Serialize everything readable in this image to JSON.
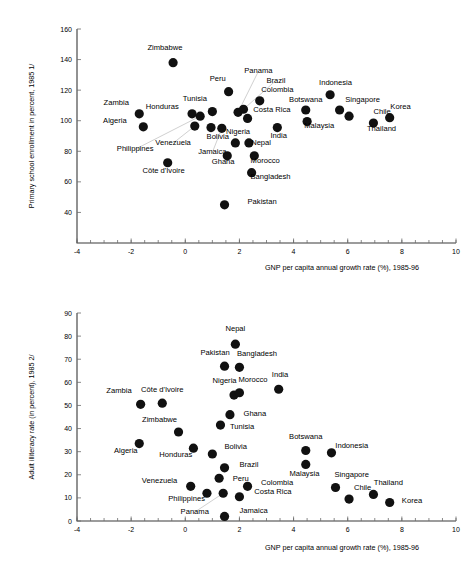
{
  "document": {
    "title": "Primary school enrollment and adult illiteracy vs GNP per capita growth"
  },
  "chart_data": [
    {
      "type": "scatter",
      "id": "chart-primary-enrollment",
      "title": "",
      "xlabel": "GNP per capita annual growth rate (%), 1985-96",
      "ylabel": "Primary school enrollment in percent, 1985 1/",
      "xlim": [
        -4,
        10
      ],
      "ylim": [
        20,
        160
      ],
      "xticks": [
        -4,
        -2,
        0,
        2,
        4,
        6,
        8,
        10
      ],
      "yticks": [
        40,
        60,
        80,
        100,
        120,
        140,
        160
      ],
      "xtick_labels": [
        "-4",
        "-2",
        "0",
        "2",
        "4",
        "6",
        "8",
        "10"
      ],
      "ytick_labels": [
        "40",
        "60",
        "80",
        "100",
        "120",
        "140",
        "160"
      ],
      "grid": false,
      "legend": "none",
      "points": [
        {
          "label": "Zimbabwe",
          "x": -0.45,
          "y": 138.0,
          "lx": -0.75,
          "ly": 146.5,
          "anchor": "middle",
          "leader": false
        },
        {
          "label": "Zambia",
          "x": -1.7,
          "y": 104.5,
          "lx": -2.55,
          "ly": 110.5,
          "anchor": "middle",
          "leader": false
        },
        {
          "label": "Algeria",
          "x": -1.55,
          "y": 96.0,
          "lx": -2.6,
          "ly": 98.5,
          "anchor": "middle",
          "leader": false
        },
        {
          "label": "Honduras",
          "x": 0.25,
          "y": 104.5,
          "lx": -0.85,
          "ly": 107.5,
          "anchor": "middle",
          "leader": false
        },
        {
          "label": "Tunisia",
          "x": 1.0,
          "y": 106.0,
          "lx": 0.35,
          "ly": 113.0,
          "anchor": "middle",
          "leader": false
        },
        {
          "label": "Peru",
          "x": 1.6,
          "y": 119.0,
          "lx": 1.2,
          "ly": 126.0,
          "anchor": "middle",
          "leader": false
        },
        {
          "label": "Panama",
          "x": 1.95,
          "y": 105.5,
          "lx": 2.7,
          "ly": 131.0,
          "anchor": "middle",
          "leader": true
        },
        {
          "label": "Brazil",
          "x": 2.15,
          "y": 107.5,
          "lx": 3.35,
          "ly": 125.0,
          "anchor": "middle",
          "leader": true
        },
        {
          "label": "Colombia",
          "x": 2.75,
          "y": 113.0,
          "lx": 3.4,
          "ly": 119.0,
          "anchor": "middle",
          "leader": false
        },
        {
          "label": "Costa Rica",
          "x": 2.3,
          "y": 101.5,
          "lx": 3.2,
          "ly": 106.0,
          "anchor": "middle",
          "leader": false
        },
        {
          "label": "Bolivia",
          "x": 0.95,
          "y": 95.5,
          "lx": 1.2,
          "ly": 88.0,
          "anchor": "middle",
          "leader": false
        },
        {
          "label": "Venezuela",
          "x": 0.35,
          "y": 96.5,
          "lx": -0.45,
          "ly": 84.0,
          "anchor": "middle",
          "leader": true
        },
        {
          "label": "Philippines",
          "x": 0.55,
          "y": 103.0,
          "lx": -1.85,
          "ly": 80.0,
          "anchor": "middle",
          "leader": true
        },
        {
          "label": "Jamaica",
          "x": 1.35,
          "y": 95.0,
          "lx": 1.0,
          "ly": 78.0,
          "anchor": "middle",
          "leader": true
        },
        {
          "label": "Nigeria",
          "x": 1.85,
          "y": 85.5,
          "lx": 1.95,
          "ly": 91.0,
          "anchor": "middle",
          "leader": false
        },
        {
          "label": "Nepal",
          "x": 2.35,
          "y": 85.5,
          "lx": 2.8,
          "ly": 84.0,
          "anchor": "middle",
          "leader": false
        },
        {
          "label": "Ghana",
          "x": 1.55,
          "y": 77.0,
          "lx": 1.4,
          "ly": 71.5,
          "anchor": "middle",
          "leader": false
        },
        {
          "label": "Morocco",
          "x": 2.55,
          "y": 77.0,
          "lx": 2.95,
          "ly": 72.5,
          "anchor": "middle",
          "leader": false
        },
        {
          "label": "Bangladesh",
          "x": 2.45,
          "y": 66.0,
          "lx": 3.15,
          "ly": 62.0,
          "anchor": "middle",
          "leader": false
        },
        {
          "label": "Côte d'Ivoire",
          "x": -0.65,
          "y": 72.5,
          "lx": -0.8,
          "ly": 65.5,
          "anchor": "middle",
          "leader": false
        },
        {
          "label": "Pakistan",
          "x": 1.45,
          "y": 45.0,
          "lx": 2.3,
          "ly": 45.5,
          "anchor": "start",
          "leader": false
        },
        {
          "label": "India",
          "x": 3.4,
          "y": 95.5,
          "lx": 3.45,
          "ly": 89.0,
          "anchor": "middle",
          "leader": false
        },
        {
          "label": "Botswana",
          "x": 4.45,
          "y": 107.0,
          "lx": 4.45,
          "ly": 112.5,
          "anchor": "middle",
          "leader": false
        },
        {
          "label": "Malaysia",
          "x": 4.5,
          "y": 99.5,
          "lx": 4.95,
          "ly": 95.5,
          "anchor": "middle",
          "leader": false
        },
        {
          "label": "Indonesia",
          "x": 5.35,
          "y": 117.0,
          "lx": 5.55,
          "ly": 123.5,
          "anchor": "middle",
          "leader": false
        },
        {
          "label": "Singapore",
          "x": 5.7,
          "y": 107.0,
          "lx": 6.55,
          "ly": 112.5,
          "anchor": "middle",
          "leader": false
        },
        {
          "label": "Chile",
          "x": 6.05,
          "y": 103.0,
          "lx": 6.95,
          "ly": 104.5,
          "anchor": "start",
          "leader": false
        },
        {
          "label": "Thailand",
          "x": 6.95,
          "y": 98.5,
          "lx": 7.25,
          "ly": 93.0,
          "anchor": "middle",
          "leader": false
        },
        {
          "label": "Korea",
          "x": 7.55,
          "y": 102.0,
          "lx": 7.95,
          "ly": 107.5,
          "anchor": "middle",
          "leader": false
        }
      ]
    },
    {
      "type": "scatter",
      "id": "chart-adult-illiteracy",
      "title": "",
      "xlabel": "GNP per capita annual growth rate (%), 1985-96",
      "ylabel": "Adult illiteracy rate  (in percent), 1985 2/",
      "xlim": [
        -4,
        10
      ],
      "ylim": [
        0,
        90
      ],
      "xticks": [
        -4,
        -2,
        0,
        2,
        4,
        6,
        8,
        10
      ],
      "yticks": [
        0,
        10,
        20,
        30,
        40,
        50,
        60,
        70,
        80,
        90
      ],
      "xtick_labels": [
        "-4",
        "-2",
        "0",
        "2",
        "4",
        "6",
        "8",
        "10"
      ],
      "ytick_labels": [
        "0",
        "10",
        "20",
        "30",
        "40",
        "50",
        "60",
        "70",
        "80",
        "90"
      ],
      "grid": false,
      "legend": "none",
      "points": [
        {
          "label": "Nepal",
          "x": 1.85,
          "y": 76.5,
          "lx": 1.85,
          "ly": 82.0,
          "anchor": "middle",
          "leader": false
        },
        {
          "label": "Pakistan",
          "x": 1.45,
          "y": 67.0,
          "lx": 1.1,
          "ly": 72.0,
          "anchor": "middle",
          "leader": false
        },
        {
          "label": "Bangladesh",
          "x": 2.0,
          "y": 66.5,
          "lx": 2.65,
          "ly": 71.5,
          "anchor": "middle",
          "leader": false
        },
        {
          "label": "India",
          "x": 3.45,
          "y": 57.0,
          "lx": 3.5,
          "ly": 62.5,
          "anchor": "middle",
          "leader": false
        },
        {
          "label": "Nigeria",
          "x": 1.8,
          "y": 54.5,
          "lx": 1.45,
          "ly": 59.5,
          "anchor": "middle",
          "leader": false
        },
        {
          "label": "Morocco",
          "x": 2.0,
          "y": 55.5,
          "lx": 2.5,
          "ly": 60.0,
          "anchor": "middle",
          "leader": false
        },
        {
          "label": "Zambia",
          "x": -1.65,
          "y": 50.5,
          "lx": -2.45,
          "ly": 55.5,
          "anchor": "middle",
          "leader": false
        },
        {
          "label": "Côte d'Ivoire",
          "x": -0.85,
          "y": 51.0,
          "lx": -0.85,
          "ly": 56.0,
          "anchor": "middle",
          "leader": false
        },
        {
          "label": "Ghana",
          "x": 1.65,
          "y": 46.0,
          "lx": 2.15,
          "ly": 45.5,
          "anchor": "start",
          "leader": false
        },
        {
          "label": "Tunisia",
          "x": 1.3,
          "y": 41.5,
          "lx": 1.65,
          "ly": 40.0,
          "anchor": "start",
          "leader": false
        },
        {
          "label": "Zimbabwe",
          "x": -0.25,
          "y": 38.5,
          "lx": -0.95,
          "ly": 43.0,
          "anchor": "middle",
          "leader": false
        },
        {
          "label": "Algeria",
          "x": -1.7,
          "y": 33.5,
          "lx": -2.2,
          "ly": 29.5,
          "anchor": "middle",
          "leader": false
        },
        {
          "label": "Honduras",
          "x": 0.3,
          "y": 31.5,
          "lx": -0.35,
          "ly": 27.5,
          "anchor": "middle",
          "leader": false
        },
        {
          "label": "Bolivia",
          "x": 1.0,
          "y": 29.0,
          "lx": 1.45,
          "ly": 31.0,
          "anchor": "start",
          "leader": false
        },
        {
          "label": "Botswana",
          "x": 4.45,
          "y": 30.5,
          "lx": 4.45,
          "ly": 35.5,
          "anchor": "middle",
          "leader": false
        },
        {
          "label": "Indonesia",
          "x": 5.4,
          "y": 29.5,
          "lx": 6.15,
          "ly": 31.5,
          "anchor": "middle",
          "leader": false
        },
        {
          "label": "Malaysia",
          "x": 4.45,
          "y": 24.5,
          "lx": 4.4,
          "ly": 19.5,
          "anchor": "middle",
          "leader": false
        },
        {
          "label": "Brazil",
          "x": 1.45,
          "y": 23.0,
          "lx": 2.0,
          "ly": 23.5,
          "anchor": "start",
          "leader": false
        },
        {
          "label": "Peru",
          "x": 1.25,
          "y": 18.5,
          "lx": 1.75,
          "ly": 17.5,
          "anchor": "start",
          "leader": false
        },
        {
          "label": "Colombia",
          "x": 2.3,
          "y": 15.0,
          "lx": 2.8,
          "ly": 15.5,
          "anchor": "start",
          "leader": false
        },
        {
          "label": "Venezuela",
          "x": 0.2,
          "y": 15.0,
          "lx": -0.95,
          "ly": 16.5,
          "anchor": "middle",
          "leader": false
        },
        {
          "label": "Philippines",
          "x": 0.8,
          "y": 12.0,
          "lx": 0.05,
          "ly": 8.5,
          "anchor": "middle",
          "leader": false
        },
        {
          "label": "Costa Rica",
          "x": 2.0,
          "y": 10.5,
          "lx": 2.55,
          "ly": 11.5,
          "anchor": "start",
          "leader": false
        },
        {
          "label": "Singapore",
          "x": 5.55,
          "y": 14.5,
          "lx": 6.15,
          "ly": 19.0,
          "anchor": "middle",
          "leader": false
        },
        {
          "label": "Chile",
          "x": 6.05,
          "y": 9.5,
          "lx": 6.55,
          "ly": 13.5,
          "anchor": "middle",
          "leader": false
        },
        {
          "label": "Thailand",
          "x": 6.95,
          "y": 11.5,
          "lx": 7.5,
          "ly": 15.5,
          "anchor": "middle",
          "leader": false
        },
        {
          "label": "Korea",
          "x": 7.55,
          "y": 8.0,
          "lx": 8.0,
          "ly": 8.0,
          "anchor": "start",
          "leader": false
        },
        {
          "label": "Panama",
          "x": 1.4,
          "y": 12.0,
          "lx": 0.35,
          "ly": 3.0,
          "anchor": "middle",
          "leader": true
        },
        {
          "label": "Jamaica",
          "x": 1.45,
          "y": 2.0,
          "lx": 2.0,
          "ly": 3.5,
          "anchor": "start",
          "leader": false
        }
      ]
    }
  ],
  "style": {
    "dot_color": "#111111",
    "axis_color": "#3a3a3a",
    "leader_color": "#b0b0b0",
    "background": "#ffffff"
  }
}
